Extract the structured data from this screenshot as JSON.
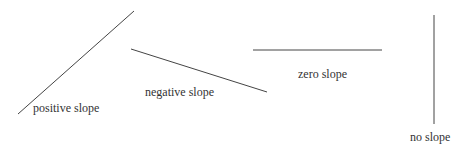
{
  "diagram": {
    "line_color": "#444444",
    "text_color": "#333333",
    "lines": [
      {
        "name": "positive",
        "x1": 18,
        "y1": 114,
        "x2": 134,
        "y2": 11,
        "label": "positive slope",
        "label_x": 33,
        "label_y": 102
      },
      {
        "name": "negative",
        "x1": 131,
        "y1": 49,
        "x2": 267,
        "y2": 92,
        "label": "negative slope",
        "label_x": 145,
        "label_y": 86
      },
      {
        "name": "zero",
        "x1": 253,
        "y1": 50,
        "x2": 382,
        "y2": 50,
        "label": "zero slope",
        "label_x": 298,
        "label_y": 68
      },
      {
        "name": "undefined",
        "x1": 434,
        "y1": 15,
        "x2": 434,
        "y2": 124,
        "label": "no slope",
        "label_x": 410,
        "label_y": 131
      }
    ]
  }
}
